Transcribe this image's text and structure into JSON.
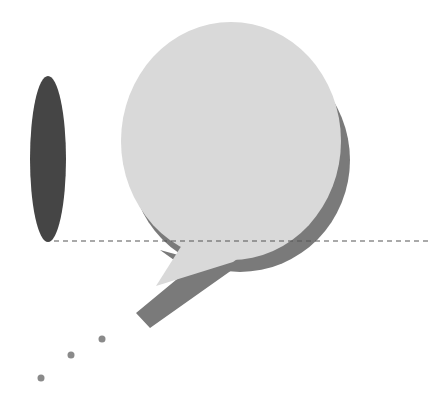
{
  "illustration": {
    "description": "speech bubble with shadow, ellipse, dashed baseline and dots",
    "colors": {
      "background": "#ffffff",
      "bubble": "#d9d9d9",
      "bubble_shadow": "#7a7a7a",
      "ellipse": "#454545",
      "dashed_line": "#555555",
      "dots": "#8a8a8a"
    }
  }
}
